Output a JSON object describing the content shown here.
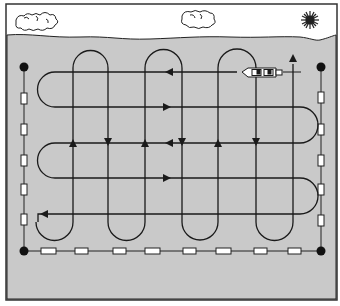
{
  "diagram": {
    "title": "Grid search pattern over water area",
    "type": "search-pattern-illustration",
    "colors": {
      "sky": "#ffffff",
      "water": "#c9c9c9",
      "line": "#1a1a1a",
      "marker_fill": "#ffffff",
      "border": "#333333"
    },
    "elements": {
      "clouds": 2,
      "sun": 1,
      "boat": 1,
      "corner_buoys": 4,
      "left_markers": 5,
      "right_markers": 5,
      "bottom_markers": 8
    },
    "horizontal_legs_y": [
      72,
      107,
      143,
      178,
      214
    ],
    "vertical_legs_x": [
      73,
      108,
      145,
      182,
      218,
      256,
      293
    ]
  }
}
